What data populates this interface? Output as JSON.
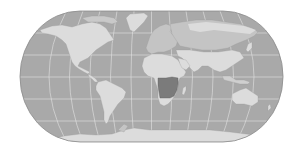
{
  "map": {
    "projection": "pseudocylindrical-world",
    "highlighted_region": "Southern Africa",
    "colors": {
      "background": "#ffffff",
      "ocean": "#a9a9a9",
      "land": "#dcdcdc",
      "land_secondary": "#b9b9b9",
      "highlight": "#7b7b7b",
      "graticule": "#e8e8e8",
      "border": "#8a8a8a",
      "outline": "#8c8c8c"
    },
    "continents": [
      {
        "name": "North America"
      },
      {
        "name": "Greenland"
      },
      {
        "name": "South America"
      },
      {
        "name": "Europe"
      },
      {
        "name": "Africa"
      },
      {
        "name": "Asia"
      },
      {
        "name": "Russia"
      },
      {
        "name": "Australia"
      },
      {
        "name": "Antarctica"
      },
      {
        "name": "Madagascar"
      }
    ]
  }
}
